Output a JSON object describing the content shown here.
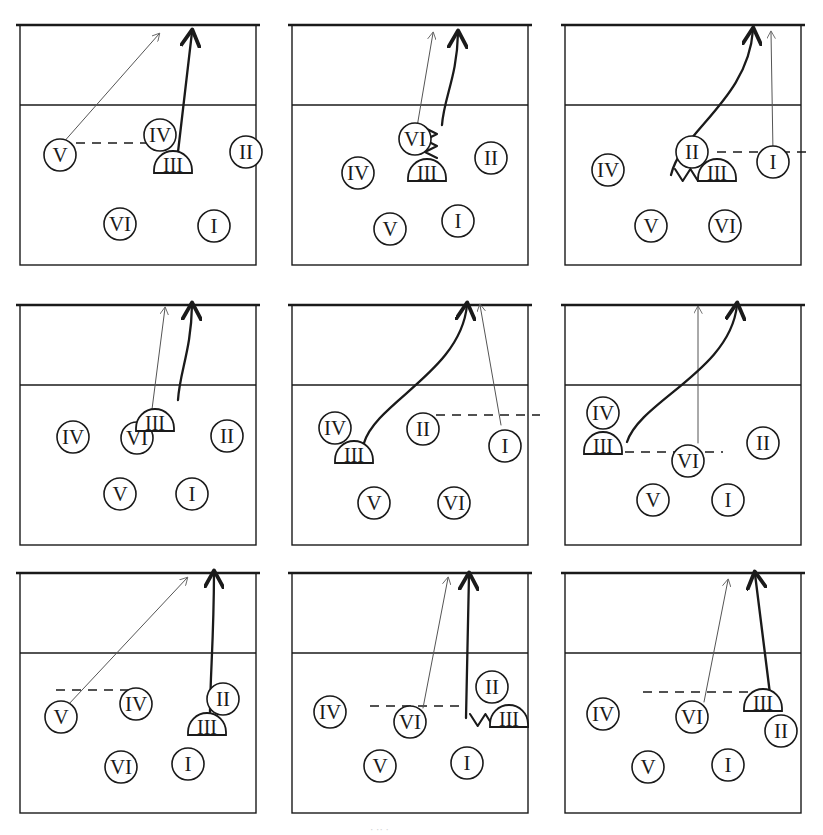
{
  "figure": {
    "kind": "volleyball-tactics-panel-grid",
    "panel_count": 9,
    "rows": 3,
    "cols": 3,
    "stroke_color": "#1a1a1a",
    "faint_stroke_color": "#555555",
    "background_color": "#ffffff",
    "crop_ghost_text": "·   ·       ·",
    "footer_ghost_text": "· ·· ·"
  },
  "court": {
    "court_label": "court-outline",
    "net_line_label": "net-line",
    "attack_line_label": "attack-line-3m",
    "dashed_path_label": "dashed-movement-path"
  },
  "glyphs": {
    "setter_marker": "half-dome-blocker",
    "player_marker": "circle-player",
    "roman": {
      "one": "I",
      "two": "II",
      "three": "III",
      "four": "IV",
      "five": "V",
      "six": "VI"
    }
  },
  "panels": [
    {
      "id": "panel-1",
      "index": 1,
      "players": [
        {
          "label": "V",
          "shape": "circle",
          "x": 40,
          "y": 155
        },
        {
          "label": "IV",
          "shape": "circle",
          "x": 140,
          "y": 135
        },
        {
          "label": "III",
          "shape": "dome",
          "x": 153,
          "y": 162
        },
        {
          "label": "II",
          "shape": "circle",
          "x": 226,
          "y": 152
        },
        {
          "label": "VI",
          "shape": "circle",
          "x": 100,
          "y": 224
        },
        {
          "label": "I",
          "shape": "circle",
          "x": 194,
          "y": 226
        }
      ],
      "dashed": {
        "x1": 40,
        "y1": 143,
        "x2": 138,
        "y2": 143
      },
      "arrows": [
        {
          "style": "thin",
          "kind": "straight",
          "x1": 42,
          "y1": 144,
          "x2": 139,
          "y2": 34
        },
        {
          "style": "thick",
          "kind": "straight",
          "x1": 158,
          "y1": 152,
          "x2": 172,
          "y2": 32
        }
      ],
      "squiggle": null
    },
    {
      "id": "panel-2",
      "index": 2,
      "players": [
        {
          "label": "VI",
          "shape": "circle",
          "x": 123,
          "y": 139
        },
        {
          "label": "III",
          "shape": "dome",
          "x": 135,
          "y": 170
        },
        {
          "label": "IV",
          "shape": "circle",
          "x": 66,
          "y": 173
        },
        {
          "label": "II",
          "shape": "circle",
          "x": 199,
          "y": 158
        },
        {
          "label": "V",
          "shape": "circle",
          "x": 98,
          "y": 229
        },
        {
          "label": "I",
          "shape": "circle",
          "x": 166,
          "y": 221
        }
      ],
      "dashed": null,
      "arrows": [
        {
          "style": "thin",
          "kind": "straight",
          "x1": 124,
          "y1": 133,
          "x2": 141,
          "y2": 33
        },
        {
          "style": "thick",
          "kind": "curve",
          "x1": 150,
          "y1": 125,
          "x2": 166,
          "y2": 33
        }
      ],
      "squiggle": {
        "x": 139,
        "y": 128,
        "height": 30
      }
    },
    {
      "id": "panel-3",
      "index": 3,
      "players": [
        {
          "label": "II",
          "shape": "circle",
          "x": 127,
          "y": 152
        },
        {
          "label": "III",
          "shape": "dome",
          "x": 152,
          "y": 170
        },
        {
          "label": "I",
          "shape": "circle",
          "x": 208,
          "y": 162
        },
        {
          "label": "IV",
          "shape": "circle",
          "x": 43,
          "y": 170
        },
        {
          "label": "V",
          "shape": "circle",
          "x": 86,
          "y": 226
        },
        {
          "label": "VI",
          "shape": "circle",
          "x": 160,
          "y": 226
        }
      ],
      "dashed": {
        "x1": 152,
        "y1": 152,
        "x2": 248,
        "y2": 152
      },
      "arrows": [
        {
          "style": "thick",
          "kind": "curve",
          "x1": 106,
          "y1": 175,
          "x2": 188,
          "y2": 30
        },
        {
          "style": "thin",
          "kind": "straight",
          "x1": 208,
          "y1": 152,
          "x2": 206,
          "y2": 32
        }
      ],
      "squiggle": {
        "x": 110,
        "y": 175,
        "height": 16,
        "orient": "horizontal"
      }
    },
    {
      "id": "panel-4",
      "index": 4,
      "players": [
        {
          "label": "VI",
          "shape": "circle",
          "x": 117,
          "y": 438
        },
        {
          "label": "III",
          "shape": "dome",
          "x": 135,
          "y": 420
        },
        {
          "label": "IV",
          "shape": "circle",
          "x": 53,
          "y": 437
        },
        {
          "label": "II",
          "shape": "circle",
          "x": 207,
          "y": 436
        },
        {
          "label": "V",
          "shape": "circle",
          "x": 100,
          "y": 494
        },
        {
          "label": "I",
          "shape": "circle",
          "x": 172,
          "y": 494
        }
      ],
      "dashed": null,
      "arrows": [
        {
          "style": "thin",
          "kind": "straight",
          "x1": 130,
          "y1": 425,
          "x2": 145,
          "y2": 308
        },
        {
          "style": "thick",
          "kind": "curve",
          "x1": 158,
          "y1": 400,
          "x2": 172,
          "y2": 305
        }
      ],
      "squiggle": null
    },
    {
      "id": "panel-5",
      "index": 5,
      "players": [
        {
          "label": "IV",
          "shape": "circle",
          "x": 43,
          "y": 428
        },
        {
          "label": "III",
          "shape": "dome",
          "x": 62,
          "y": 452
        },
        {
          "label": "II",
          "shape": "circle",
          "x": 131,
          "y": 429
        },
        {
          "label": "I",
          "shape": "circle",
          "x": 213,
          "y": 446
        },
        {
          "label": "V",
          "shape": "circle",
          "x": 82,
          "y": 503
        },
        {
          "label": "VI",
          "shape": "circle",
          "x": 162,
          "y": 503
        }
      ],
      "dashed": {
        "x1": 128,
        "y1": 415,
        "x2": 248,
        "y2": 415
      },
      "arrows": [
        {
          "style": "thick",
          "kind": "curve",
          "x1": 72,
          "y1": 443,
          "x2": 175,
          "y2": 305
        },
        {
          "style": "thin",
          "kind": "straight",
          "x1": 209,
          "y1": 425,
          "x2": 188,
          "y2": 305
        }
      ],
      "squiggle": null
    },
    {
      "id": "panel-6",
      "index": 6,
      "players": [
        {
          "label": "IV",
          "shape": "circle",
          "x": 38,
          "y": 413
        },
        {
          "label": "III",
          "shape": "dome",
          "x": 38,
          "y": 443
        },
        {
          "label": "VI",
          "shape": "circle",
          "x": 123,
          "y": 461
        },
        {
          "label": "II",
          "shape": "circle",
          "x": 198,
          "y": 443
        },
        {
          "label": "V",
          "shape": "circle",
          "x": 88,
          "y": 500
        },
        {
          "label": "I",
          "shape": "circle",
          "x": 163,
          "y": 500
        }
      ],
      "dashed": {
        "x1": 60,
        "y1": 452,
        "x2": 158,
        "y2": 452
      },
      "arrows": [
        {
          "style": "thin",
          "kind": "straight",
          "x1": 133,
          "y1": 443,
          "x2": 133,
          "y2": 307
        },
        {
          "style": "thick",
          "kind": "curve",
          "x1": 62,
          "y1": 442,
          "x2": 172,
          "y2": 305
        }
      ],
      "squiggle": null
    },
    {
      "id": "panel-7",
      "index": 7,
      "players": [
        {
          "label": "V",
          "shape": "circle",
          "x": 41,
          "y": 717
        },
        {
          "label": "IV",
          "shape": "circle",
          "x": 116,
          "y": 704
        },
        {
          "label": "II",
          "shape": "circle",
          "x": 203,
          "y": 699
        },
        {
          "label": "III",
          "shape": "dome",
          "x": 187,
          "y": 724
        },
        {
          "label": "VI",
          "shape": "circle",
          "x": 101,
          "y": 767
        },
        {
          "label": "I",
          "shape": "circle",
          "x": 168,
          "y": 764
        }
      ],
      "dashed": {
        "x1": 36,
        "y1": 690,
        "x2": 116,
        "y2": 690
      },
      "arrows": [
        {
          "style": "thin",
          "kind": "straight",
          "x1": 48,
          "y1": 705,
          "x2": 167,
          "y2": 578
        },
        {
          "style": "thick",
          "kind": "curve",
          "x1": 190,
          "y1": 712,
          "x2": 194,
          "y2": 573
        }
      ],
      "squiggle": null
    },
    {
      "id": "panel-8",
      "index": 8,
      "players": [
        {
          "label": "IV",
          "shape": "circle",
          "x": 38,
          "y": 712
        },
        {
          "label": "VI",
          "shape": "circle",
          "x": 118,
          "y": 722
        },
        {
          "label": "II",
          "shape": "circle",
          "x": 200,
          "y": 687
        },
        {
          "label": "III",
          "shape": "dome",
          "x": 217,
          "y": 716
        },
        {
          "label": "V",
          "shape": "circle",
          "x": 88,
          "y": 766
        },
        {
          "label": "I",
          "shape": "circle",
          "x": 175,
          "y": 763
        }
      ],
      "dashed": {
        "x1": 78,
        "y1": 706,
        "x2": 172,
        "y2": 706
      },
      "arrows": [
        {
          "style": "thin",
          "kind": "straight",
          "x1": 131,
          "y1": 708,
          "x2": 156,
          "y2": 578
        },
        {
          "style": "thick",
          "kind": "straight",
          "x1": 174,
          "y1": 718,
          "x2": 177,
          "y2": 575
        }
      ],
      "squiggle": {
        "x": 178,
        "y": 720,
        "height": 16,
        "orient": "horizontal"
      }
    },
    {
      "id": "panel-9",
      "index": 9,
      "players": [
        {
          "label": "IV",
          "shape": "circle",
          "x": 38,
          "y": 714
        },
        {
          "label": "VI",
          "shape": "circle",
          "x": 127,
          "y": 717
        },
        {
          "label": "III",
          "shape": "dome",
          "x": 198,
          "y": 700
        },
        {
          "label": "II",
          "shape": "circle",
          "x": 216,
          "y": 731
        },
        {
          "label": "V",
          "shape": "circle",
          "x": 83,
          "y": 767
        },
        {
          "label": "I",
          "shape": "circle",
          "x": 163,
          "y": 765
        }
      ],
      "dashed": {
        "x1": 78,
        "y1": 692,
        "x2": 184,
        "y2": 692
      },
      "arrows": [
        {
          "style": "thin",
          "kind": "straight",
          "x1": 139,
          "y1": 702,
          "x2": 163,
          "y2": 580
        },
        {
          "style": "thick",
          "kind": "straight",
          "x1": 205,
          "y1": 694,
          "x2": 190,
          "y2": 574
        }
      ],
      "squiggle": null
    }
  ],
  "panel_geometry": {
    "width": 236,
    "height": 240,
    "net_y": 0,
    "attack_line_offset": 80,
    "row_tops": [
      25,
      305,
      573
    ],
    "col_lefts": [
      20,
      292,
      565
    ]
  }
}
